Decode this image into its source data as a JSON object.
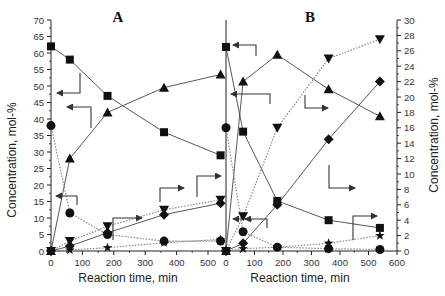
{
  "chart_data": [
    {
      "type": "line",
      "panel": "A",
      "title": "A",
      "xlabel": "Reaction time, min",
      "ylabel": "Concentration, mol-%",
      "xlim": [
        0,
        560
      ],
      "ylim": [
        0,
        70
      ],
      "x_ticks": [
        0,
        100,
        200,
        300,
        400,
        500
      ],
      "y_ticks": [
        0,
        5,
        10,
        15,
        20,
        25,
        30,
        35,
        40,
        45,
        50,
        55,
        60,
        65,
        70
      ],
      "y_axis": "left",
      "x": [
        0,
        60,
        180,
        360,
        540
      ],
      "series": [
        {
          "name": "square",
          "marker": "square",
          "line": "solid",
          "values": [
            62,
            58,
            47,
            36,
            29
          ]
        },
        {
          "name": "triangle-up",
          "marker": "triangle-up",
          "line": "solid",
          "values": [
            0,
            28,
            42,
            49.5,
            53.5
          ]
        },
        {
          "name": "circle",
          "marker": "circle",
          "line": "dotted",
          "values": [
            38,
            11.5,
            5,
            3,
            3
          ]
        },
        {
          "name": "triangle-down",
          "marker": "triangle-down",
          "line": "dotted",
          "values": [
            0,
            3,
            7.5,
            12.5,
            15.5
          ]
        },
        {
          "name": "diamond",
          "marker": "diamond",
          "line": "solid",
          "values": [
            0,
            1.5,
            5.5,
            11,
            14.5
          ]
        },
        {
          "name": "star",
          "marker": "star",
          "line": "dotted",
          "values": [
            0,
            0.3,
            1,
            2.5,
            3.5
          ]
        }
      ],
      "annotations": [
        "arrow square to left axis",
        "arrow triangle-up to left axis",
        "arrow circle to left axis",
        "arrows pointing right for minor products"
      ]
    },
    {
      "type": "line",
      "panel": "B",
      "title": "B",
      "xlabel": "Reaction time, min",
      "ylabel": "Concentration, mol-%",
      "xlim": [
        0,
        600
      ],
      "ylim": [
        0,
        30
      ],
      "x_ticks": [
        0,
        100,
        200,
        300,
        400,
        500,
        600
      ],
      "y_ticks": [
        0,
        2,
        4,
        6,
        8,
        10,
        12,
        14,
        16,
        18,
        20,
        22,
        24,
        26,
        28,
        30
      ],
      "y_axis": "right",
      "x": [
        0,
        60,
        180,
        360,
        540
      ],
      "series": [
        {
          "name": "square",
          "marker": "square",
          "line": "solid",
          "values": [
            26.5,
            15.5,
            6.5,
            4,
            3
          ]
        },
        {
          "name": "triangle-up",
          "marker": "triangle-up",
          "line": "solid",
          "values": [
            0,
            22,
            25.5,
            21,
            17.5
          ]
        },
        {
          "name": "triangle-down",
          "marker": "triangle-down",
          "line": "dotted",
          "values": [
            0,
            4.5,
            16,
            25,
            27.5
          ]
        },
        {
          "name": "diamond",
          "marker": "diamond",
          "line": "solid",
          "values": [
            0,
            1,
            6,
            14.5,
            22
          ]
        },
        {
          "name": "circle",
          "marker": "circle",
          "line": "dotted",
          "values": [
            16,
            2.5,
            0.5,
            0.3,
            0.2
          ]
        },
        {
          "name": "star",
          "marker": "star",
          "line": "dotted",
          "values": [
            0,
            0.3,
            0.5,
            1,
            2
          ]
        }
      ]
    }
  ],
  "labels": {
    "panel_a": "A",
    "panel_b": "B",
    "xlabel_a": "Reaction time, min",
    "xlabel_b": "Reaction time, min",
    "ylabel_left": "Concentration, mol-%",
    "ylabel_right": "Concentration, mol-%"
  }
}
